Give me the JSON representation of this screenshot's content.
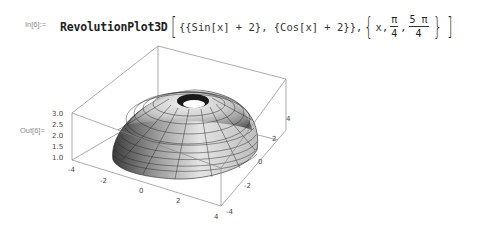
{
  "input_cell": {
    "label": "In[6]:=",
    "function": "RevolutionPlot3D",
    "args_code": "{{Sin[x] + 2}, {Cos[x] + 2}}, ",
    "range_var": "x, ",
    "range_min_num": "π",
    "range_min_den": "4",
    "range_sep": ",",
    "range_max_num": "5 π",
    "range_max_den": "4"
  },
  "output_cell": {
    "label": "Out[6]=",
    "plot": {
      "type": "3D revolution surface",
      "z_ticks": [
        "3.0",
        "2.5",
        "2.0",
        "1.5",
        "1.0"
      ],
      "x_ticks": [
        "-4",
        "-2",
        "0",
        "2",
        "4"
      ],
      "y_ticks": [
        "-4",
        "-2",
        "0",
        "2",
        "4"
      ]
    }
  }
}
